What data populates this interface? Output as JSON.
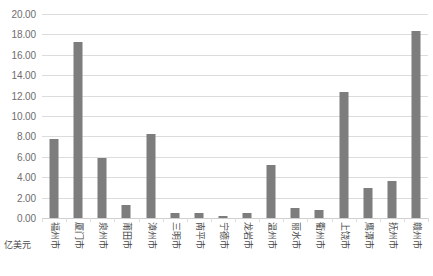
{
  "chart_data": {
    "type": "bar",
    "title": "",
    "subtitle": "",
    "xlabel": "",
    "ylabel": "",
    "unit_label": "亿美元",
    "legend": [
      "亿美元"
    ],
    "legend_position": "bottom-left",
    "grid": true,
    "ylim": [
      0,
      20
    ],
    "ystep": 2,
    "ytick_labels": [
      "0.00",
      "2.00",
      "4.00",
      "6.00",
      "8.00",
      "10.00",
      "12.00",
      "14.00",
      "16.00",
      "18.00",
      "20.00"
    ],
    "ytick_values": [
      0,
      2,
      4,
      6,
      8,
      10,
      12,
      14,
      16,
      18,
      20
    ],
    "categories": [
      "福州市",
      "厦门市",
      "泉州市",
      "莆田市",
      "漳州市",
      "三明市",
      "南平市",
      "宁德市",
      "龙岩市",
      "温州市",
      "丽水市",
      "衢州市",
      "上饶市",
      "鹰潭市",
      "抚州市",
      "赣州市"
    ],
    "values": [
      7.7,
      17.3,
      5.9,
      1.25,
      8.2,
      0.45,
      0.5,
      0.15,
      0.45,
      5.2,
      1.0,
      0.8,
      12.4,
      2.95,
      3.6,
      18.3
    ],
    "series": [
      {
        "name": "亿美元",
        "color": "#7d7d7d",
        "values": [
          7.7,
          17.3,
          5.9,
          1.25,
          8.2,
          0.45,
          0.5,
          0.15,
          0.45,
          5.2,
          1.0,
          0.8,
          12.4,
          2.95,
          3.6,
          18.3
        ]
      }
    ]
  },
  "colors": {
    "bar": "#7d7d7d",
    "gridline": "#dcdcdc",
    "axis_text": "#6e6e6e",
    "category_text": "#4a4a4a",
    "background": "#ffffff"
  }
}
